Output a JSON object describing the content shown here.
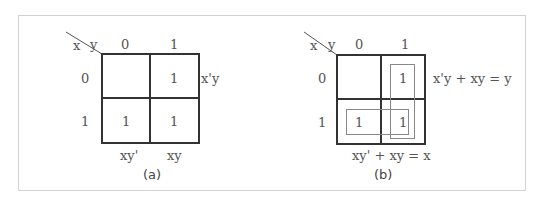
{
  "figure_a": {
    "corner_x": "x",
    "corner_y": "y",
    "col_headers": [
      "0",
      "1"
    ],
    "row_headers": [
      "0",
      "1"
    ],
    "cells": [
      [
        "",
        "1"
      ],
      [
        "1",
        "1"
      ]
    ],
    "right_label_row0": "x'y",
    "bottom_labels": [
      "xy'",
      "xy"
    ],
    "caption": "(a)"
  },
  "figure_b": {
    "corner_x": "x",
    "corner_y": "y",
    "col_headers": [
      "0",
      "1"
    ],
    "row_headers": [
      "0",
      "1"
    ],
    "cells": [
      [
        "",
        "1"
      ],
      [
        "1",
        "1"
      ]
    ],
    "right_label": "x'y + xy = y",
    "bottom_label": "xy' + xy = x",
    "caption": "(b)",
    "groups": [
      {
        "name": "vertical-group",
        "cells": "column y=1",
        "result": "y"
      },
      {
        "name": "horizontal-group",
        "cells": "row x=1",
        "result": "x"
      }
    ]
  }
}
